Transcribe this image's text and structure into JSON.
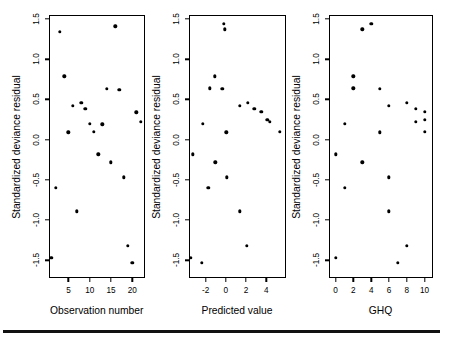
{
  "figure": {
    "panel_count": 3,
    "shared_ylabel": "Standardized deviance residual",
    "y_ticks": [
      "-1.5",
      "-1.0",
      "-0.5",
      "0.0",
      "0.5",
      "1.0",
      "1.5"
    ],
    "y_tick_values": [
      -1.5,
      -1.0,
      -0.5,
      0.0,
      0.5,
      1.0,
      1.5
    ],
    "ylim": [
      -1.72,
      1.55
    ],
    "point_color": "#000000",
    "axis_color": "#000000",
    "background": "#ffffff",
    "rule_color": "#111111"
  },
  "panels": [
    {
      "id": "panel-observation-number",
      "xlabel": "Observation number",
      "ylabel": "Standardized deviance residual",
      "x_ticks": [
        "5",
        "10",
        "15",
        "20"
      ],
      "x_tick_values": [
        5,
        10,
        15,
        20
      ],
      "xlim": [
        0.3,
        23.0
      ]
    },
    {
      "id": "panel-predicted-value",
      "xlabel": "Predicted value",
      "ylabel": "Standardized deviance residual",
      "x_ticks": [
        "-2",
        "0",
        "2",
        "4"
      ],
      "x_tick_values": [
        -2,
        0,
        2,
        4
      ],
      "xlim": [
        -3.7,
        5.9
      ]
    },
    {
      "id": "panel-ghq",
      "xlabel": "GHQ",
      "ylabel": "Standardized deviance residual",
      "x_ticks": [
        "0",
        "2",
        "4",
        "6",
        "8",
        "10"
      ],
      "x_tick_values": [
        0,
        2,
        4,
        6,
        8,
        10
      ],
      "xlim": [
        -0.8,
        10.9
      ]
    }
  ],
  "chart_data": [
    {
      "type": "scatter",
      "title": "",
      "xlabel": "Observation number",
      "ylabel": "Standardized deviance residual",
      "xlim": [
        0.3,
        23.0
      ],
      "ylim": [
        -1.72,
        1.55
      ],
      "xticks": [
        5,
        10,
        15,
        20
      ],
      "yticks": [
        -1.5,
        -1.0,
        -0.5,
        0.0,
        0.5,
        1.0,
        1.5
      ],
      "grid": false,
      "legend": "none",
      "x": [
        1,
        2,
        3,
        4,
        5,
        6,
        7,
        8,
        9,
        10,
        11,
        12,
        13,
        14,
        15,
        16,
        17,
        18,
        19,
        20,
        21,
        22
      ],
      "y": [
        -1.47,
        -0.6,
        1.34,
        0.79,
        0.09,
        0.42,
        -0.89,
        0.46,
        0.38,
        0.2,
        0.1,
        -0.18,
        0.19,
        0.63,
        -0.28,
        1.41,
        0.62,
        -0.47,
        -1.32,
        -1.53,
        0.34,
        0.22
      ]
    },
    {
      "type": "scatter",
      "title": "",
      "xlabel": "Predicted value",
      "ylabel": "Standardized deviance residual",
      "xlim": [
        -3.7,
        5.9
      ],
      "ylim": [
        -1.72,
        1.55
      ],
      "xticks": [
        -2,
        0,
        2,
        4
      ],
      "yticks": [
        -1.5,
        -1.0,
        -0.5,
        0.0,
        0.5,
        1.0,
        1.5
      ],
      "grid": false,
      "legend": "none",
      "x": [
        -3.45,
        -3.3,
        -2.4,
        -2.3,
        -1.75,
        -1.6,
        -1.1,
        -1.05,
        -0.35,
        -0.2,
        -0.1,
        0.05,
        0.1,
        1.35,
        1.4,
        2.1,
        2.15,
        2.8,
        3.5,
        4.1,
        4.35,
        5.35
      ],
      "y": [
        -1.47,
        -0.18,
        -1.53,
        0.2,
        -0.6,
        0.64,
        0.79,
        -0.28,
        0.63,
        1.44,
        1.37,
        0.09,
        -0.47,
        0.42,
        -0.89,
        -1.32,
        0.46,
        0.38,
        0.35,
        0.25,
        0.22,
        0.1
      ]
    },
    {
      "type": "scatter",
      "title": "",
      "xlabel": "GHQ",
      "ylabel": "Standardized deviance residual",
      "xlim": [
        -0.8,
        10.9
      ],
      "ylim": [
        -1.72,
        1.55
      ],
      "xticks": [
        0,
        2,
        4,
        6,
        8,
        10
      ],
      "yticks": [
        -1.5,
        -1.0,
        -0.5,
        0.0,
        0.5,
        1.0,
        1.5
      ],
      "grid": false,
      "legend": "none",
      "x": [
        0,
        0,
        1,
        1,
        2,
        2,
        3,
        3,
        4,
        5,
        5,
        6,
        6,
        6,
        7,
        8,
        8,
        9,
        9,
        10,
        10,
        10
      ],
      "y": [
        -1.47,
        -0.18,
        0.2,
        -0.6,
        0.64,
        0.79,
        -0.28,
        1.37,
        1.44,
        0.09,
        0.63,
        0.42,
        -0.47,
        -0.89,
        -1.53,
        0.46,
        -1.32,
        0.38,
        0.22,
        0.35,
        0.25,
        0.1
      ]
    }
  ]
}
